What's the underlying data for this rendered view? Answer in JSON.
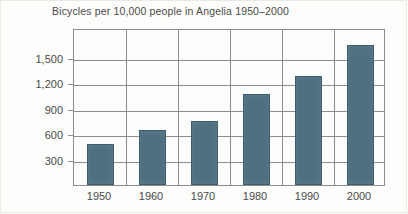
{
  "chart_data": {
    "type": "bar",
    "title": "Bicycles per 10,000 people in Angelia 1950–2000",
    "xlabel": "",
    "ylabel": "",
    "categories": [
      "1950",
      "1960",
      "1970",
      "1980",
      "1990",
      "2000"
    ],
    "values": [
      480,
      650,
      750,
      1070,
      1280,
      1650
    ],
    "ytick_labels": [
      "300",
      "600",
      "900",
      "1,200",
      "1,500"
    ],
    "ytick_values": [
      300,
      600,
      900,
      1200,
      1500
    ],
    "ylim": [
      0,
      1800
    ],
    "grid": "horizontal-and-vertical",
    "legend": "none",
    "bar_color": "#4e6f80",
    "axis_color": "#8d8d8d",
    "text_color": "#4a4a4a",
    "background": "#fdfdfc"
  }
}
